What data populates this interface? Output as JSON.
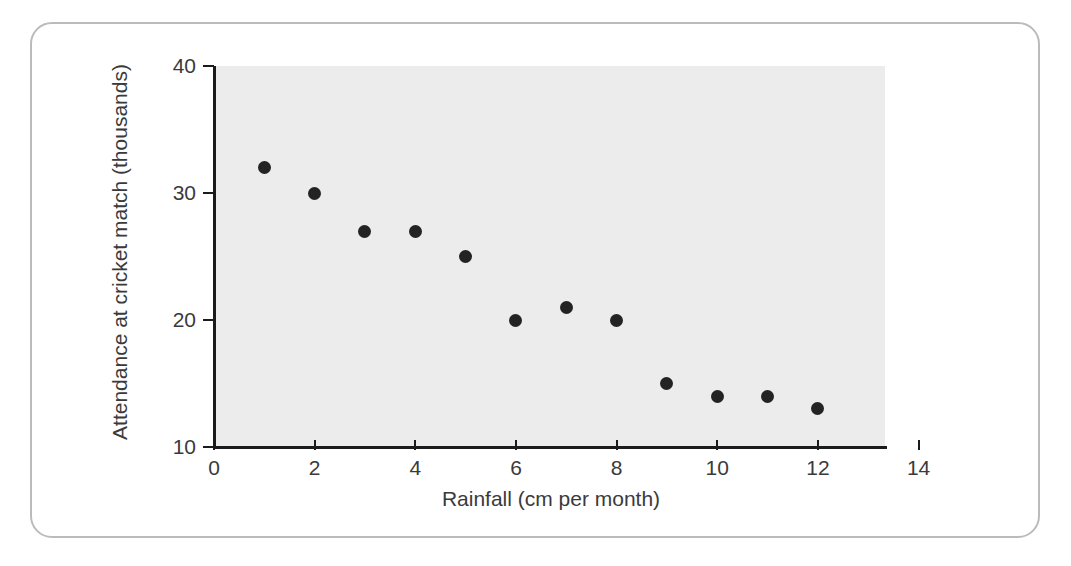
{
  "figure": {
    "border_color": "#b9bbbd",
    "plot_background": "#ececed",
    "axis_color": "#1b1b1b",
    "marker_color": "#232323",
    "label_color": "#3a3a3c"
  },
  "chart_data": {
    "type": "scatter",
    "title": "",
    "xlabel": "Rainfall (cm per month)",
    "ylabel": "Attendance at cricket match (thousands)",
    "xlim": [
      0,
      14
    ],
    "ylim": [
      10,
      40
    ],
    "xticks": [
      0,
      2,
      4,
      6,
      8,
      10,
      12,
      14
    ],
    "xtick_labels": [
      "0",
      "2",
      "4",
      "6",
      "8",
      "10",
      "12",
      "14"
    ],
    "yticks": [
      10,
      20,
      30,
      40
    ],
    "ytick_labels": [
      "10",
      "20",
      "30",
      "40"
    ],
    "grid": false,
    "legend": null,
    "series": [
      {
        "name": "Attendance vs rainfall",
        "x": [
          1,
          2,
          3,
          4,
          5,
          6,
          7,
          8,
          9,
          10,
          11,
          12
        ],
        "y": [
          32,
          30,
          27,
          27,
          25,
          20,
          21,
          20,
          15,
          14,
          14,
          13
        ],
        "points": [
          {
            "x": 1,
            "y": 32
          },
          {
            "x": 2,
            "y": 30
          },
          {
            "x": 3,
            "y": 27
          },
          {
            "x": 4,
            "y": 27
          },
          {
            "x": 5,
            "y": 25
          },
          {
            "x": 6,
            "y": 20
          },
          {
            "x": 7,
            "y": 21
          },
          {
            "x": 8,
            "y": 20
          },
          {
            "x": 9,
            "y": 15
          },
          {
            "x": 10,
            "y": 14
          },
          {
            "x": 11,
            "y": 14
          },
          {
            "x": 12,
            "y": 13
          }
        ]
      }
    ]
  }
}
